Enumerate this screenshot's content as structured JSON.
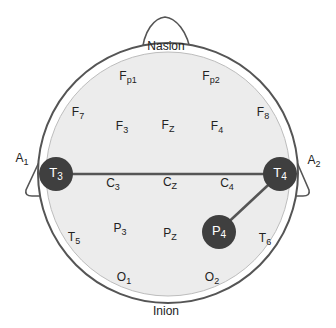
{
  "landmarks": {
    "nasion": "Nasion",
    "inion": "Inion",
    "a1": {
      "main": "A",
      "sub": "1"
    },
    "a2": {
      "main": "A",
      "sub": "2"
    }
  },
  "electrodes": {
    "fp1": {
      "main": "F",
      "sub": "p1"
    },
    "fp2": {
      "main": "F",
      "sub": "p2"
    },
    "f7": {
      "main": "F",
      "sub": "7"
    },
    "f3": {
      "main": "F",
      "sub": "3"
    },
    "fz": {
      "main": "F",
      "sub": "Z"
    },
    "f4": {
      "main": "F",
      "sub": "4"
    },
    "f8": {
      "main": "F",
      "sub": "8"
    },
    "t3": {
      "main": "T",
      "sub": "3"
    },
    "c3": {
      "main": "C",
      "sub": "3"
    },
    "cz": {
      "main": "C",
      "sub": "Z"
    },
    "c4": {
      "main": "C",
      "sub": "4"
    },
    "t4": {
      "main": "T",
      "sub": "4"
    },
    "t5": {
      "main": "T",
      "sub": "5"
    },
    "p3": {
      "main": "P",
      "sub": "3"
    },
    "pz": {
      "main": "P",
      "sub": "Z"
    },
    "p4": {
      "main": "P",
      "sub": "4"
    },
    "t6": {
      "main": "T",
      "sub": "6"
    },
    "o1": {
      "main": "O",
      "sub": "1"
    },
    "o2": {
      "main": "O",
      "sub": "2"
    }
  },
  "highlighted_electrodes": [
    "T3",
    "T4",
    "P4"
  ],
  "connections": [
    [
      "T3",
      "T4"
    ],
    [
      "T4",
      "P4"
    ]
  ],
  "colors": {
    "outline": "#555555",
    "scalp_fill": "#ececec",
    "node_fill": "#3f3f3f",
    "node_text": "#ffffff"
  }
}
